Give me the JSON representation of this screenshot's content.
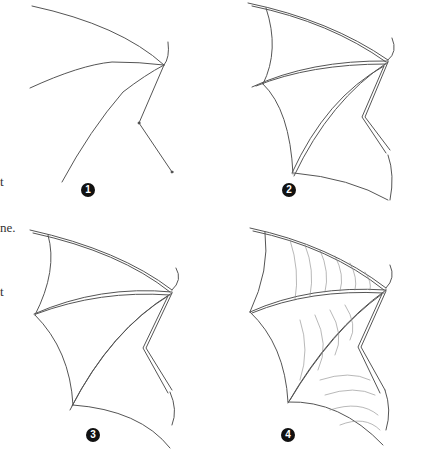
{
  "page": {
    "text_fragments": [
      "t",
      "ne.",
      "t"
    ]
  },
  "steps": [
    {
      "number": "1",
      "label": "Basic skeleton lines"
    },
    {
      "number": "2",
      "label": "Outlined bones and membrane edges"
    },
    {
      "number": "3",
      "label": "Refined bones and membrane"
    },
    {
      "number": "4",
      "label": "Shaded membrane with texture"
    }
  ]
}
